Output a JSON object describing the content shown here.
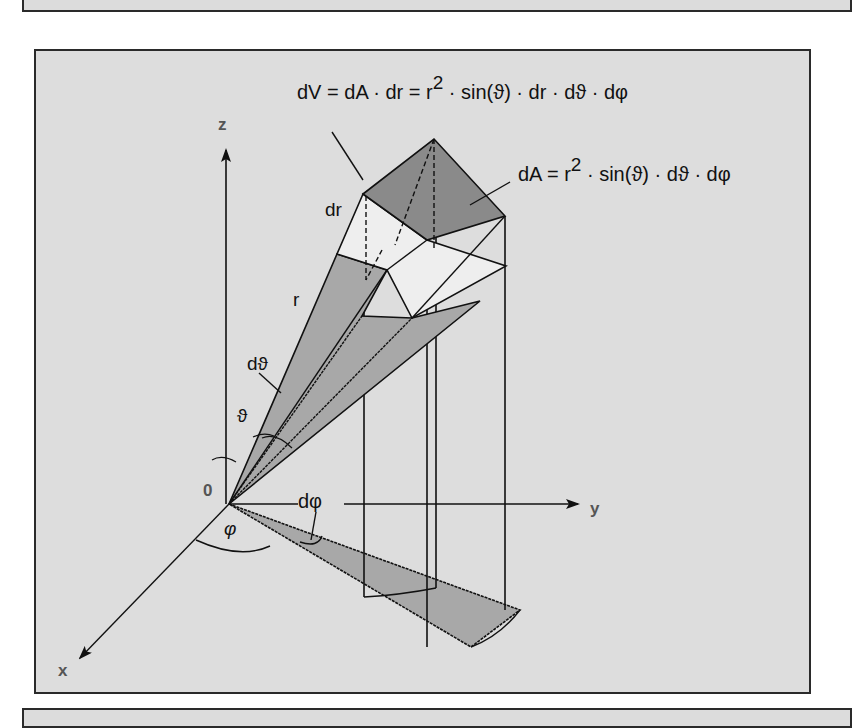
{
  "figure": {
    "formula_volume": "dV = dA · dr = r² · sin(ϑ) · dr · dϑ · dφ",
    "formula_volume_parts": {
      "lhs": "dV = dA · dr = r",
      "sup": "2",
      "rhs": " · sin(ϑ) · dr · dϑ · dφ"
    },
    "formula_area_parts": {
      "lhs": "dA = r",
      "sup": "2",
      "rhs": " · sin(ϑ) · dϑ · dφ"
    },
    "axes": {
      "x": "x",
      "y": "y",
      "z": "z",
      "origin": "0"
    },
    "labels": {
      "dr": "dr",
      "r": "r",
      "dtheta": "dϑ",
      "theta": "ϑ",
      "dphi": "dφ",
      "phi": "φ"
    },
    "colors": {
      "background": "#dddddd",
      "dark_face": "#8a8a8a",
      "mid_face": "#a8a8a8",
      "light_face": "#eeeeee",
      "line": "#111111"
    }
  }
}
